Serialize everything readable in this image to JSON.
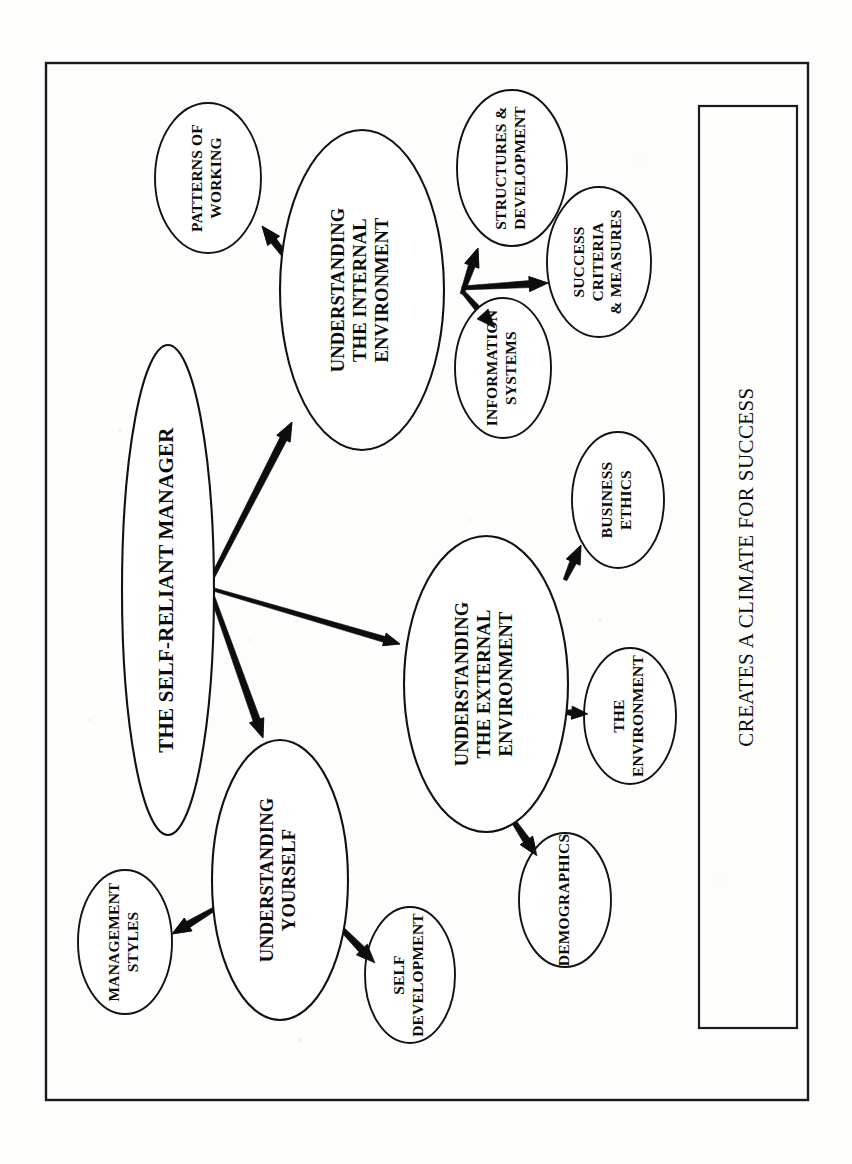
{
  "document": {
    "title": "The Self-Reliant Manager",
    "orientation": "rotated-90-ccw",
    "background_color": "#fdfdfc",
    "line_color": "#111111"
  },
  "frame": {
    "name": "outer-border"
  },
  "banner": {
    "name": "creates-a-climate-for-success-box",
    "text": "CREATES A CLIMATE FOR SUCCESS"
  },
  "nodes": {
    "root": {
      "id": "self-reliant-manager",
      "lines": [
        "THE SELF-RELIANT MANAGER"
      ],
      "cx": 168,
      "cy": 590,
      "rx": 46,
      "ry": 245,
      "font_size": 21
    },
    "branches": [
      {
        "id": "understanding-internal-environment",
        "lines": [
          "UNDERSTANDING",
          "THE INTERNAL",
          "ENVIRONMENT"
        ],
        "cx": 362,
        "cy": 290,
        "rx": 82,
        "ry": 160,
        "font_size": 18.5
      },
      {
        "id": "understanding-external-environment",
        "lines": [
          "UNDERSTANDING",
          "THE EXTERNAL",
          "ENVIRONMENT"
        ],
        "cx": 486,
        "cy": 684,
        "rx": 82,
        "ry": 148,
        "font_size": 18.5
      },
      {
        "id": "understanding-yourself",
        "lines": [
          "UNDERSTANDING",
          "YOURSELF"
        ],
        "cx": 280,
        "cy": 880,
        "rx": 68,
        "ry": 140,
        "font_size": 18.5
      }
    ],
    "leaves": [
      {
        "id": "patterns-of-working",
        "lines": [
          "PATTERNS OF",
          "WORKING"
        ],
        "cx": 208,
        "cy": 178,
        "rx": 53,
        "ry": 75,
        "font_size": 15.5
      },
      {
        "id": "structures-and-development",
        "lines": [
          "STRUCTURES &",
          "DEVELOPMENT"
        ],
        "cx": 512,
        "cy": 168,
        "rx": 55,
        "ry": 78,
        "font_size": 15.5
      },
      {
        "id": "success-criteria-and-measures",
        "lines": [
          "SUCCESS",
          "CRITERIA",
          "& MEASURES"
        ],
        "cx": 599,
        "cy": 262,
        "rx": 52,
        "ry": 75,
        "font_size": 15.5
      },
      {
        "id": "information-systems",
        "lines": [
          "INFORMATION",
          "SYSTEMS"
        ],
        "cx": 503,
        "cy": 368,
        "rx": 48,
        "ry": 70,
        "font_size": 15.5
      },
      {
        "id": "business-ethics",
        "lines": [
          "BUSINESS",
          "ETHICS"
        ],
        "cx": 618,
        "cy": 500,
        "rx": 46,
        "ry": 68,
        "font_size": 15.5
      },
      {
        "id": "the-environment",
        "lines": [
          "THE",
          "ENVIRONMENT"
        ],
        "cx": 630,
        "cy": 716,
        "rx": 46,
        "ry": 68,
        "font_size": 15.5
      },
      {
        "id": "demographics",
        "lines": [
          "DEMOGRAPHICS"
        ],
        "cx": 565,
        "cy": 900,
        "rx": 46,
        "ry": 67,
        "font_size": 15.5
      },
      {
        "id": "management-styles",
        "lines": [
          "MANAGEMENT",
          "STYLES"
        ],
        "cx": 125,
        "cy": 942,
        "rx": 47,
        "ry": 72,
        "font_size": 15.5
      },
      {
        "id": "self-development",
        "lines": [
          "SELF",
          "DEVELOPMENT"
        ],
        "cx": 410,
        "cy": 975,
        "rx": 45,
        "ry": 68,
        "font_size": 15.5
      }
    ]
  },
  "arrows": [
    {
      "id": "root-to-internal",
      "from": "self-reliant-manager",
      "to": "understanding-internal-environment",
      "x1": 210,
      "y1": 582,
      "x2": 292,
      "y2": 422,
      "width": 7.5,
      "head": 15
    },
    {
      "id": "root-to-external",
      "from": "self-reliant-manager",
      "to": "understanding-external-environment",
      "x1": 212,
      "y1": 589,
      "x2": 400,
      "y2": 644,
      "width": 6.0,
      "head": 13
    },
    {
      "id": "root-to-yourself",
      "from": "self-reliant-manager",
      "to": "understanding-yourself",
      "x1": 212,
      "y1": 595,
      "x2": 263,
      "y2": 738,
      "width": 7.5,
      "head": 15
    },
    {
      "id": "internal-to-patterns",
      "from": "understanding-internal-environment",
      "to": "patterns-of-working",
      "x1": 320,
      "y1": 300,
      "x2": 262,
      "y2": 226,
      "width": 7.0,
      "head": 15
    },
    {
      "id": "internal-to-structures",
      "from": "understanding-internal-environment",
      "to": "structures-and-development",
      "x1": 462,
      "y1": 294,
      "x2": 478,
      "y2": 248,
      "width": 7.0,
      "head": 15
    },
    {
      "id": "internal-to-success",
      "from": "understanding-internal-environment",
      "to": "success-criteria-and-measures",
      "x1": 462,
      "y1": 288,
      "x2": 548,
      "y2": 283,
      "width": 7.0,
      "head": 15
    },
    {
      "id": "internal-to-information",
      "from": "understanding-internal-environment",
      "to": "information-systems",
      "x1": 463,
      "y1": 292,
      "x2": 495,
      "y2": 328,
      "width": 7.0,
      "head": 15
    },
    {
      "id": "external-to-ethics",
      "from": "understanding-external-environment",
      "to": "business-ethics",
      "x1": 565,
      "y1": 580,
      "x2": 581,
      "y2": 545,
      "width": 7.0,
      "head": 15
    },
    {
      "id": "external-to-environment",
      "from": "understanding-external-environment",
      "to": "the-environment",
      "x1": 563,
      "y1": 712,
      "x2": 588,
      "y2": 714,
      "width": 6.0,
      "head": 13
    },
    {
      "id": "external-to-demographics",
      "from": "understanding-external-environment",
      "to": "demographics",
      "x1": 510,
      "y1": 816,
      "x2": 537,
      "y2": 856,
      "width": 7.5,
      "head": 15
    },
    {
      "id": "yourself-to-management",
      "from": "understanding-yourself",
      "to": "management-styles",
      "x1": 216,
      "y1": 908,
      "x2": 172,
      "y2": 934,
      "width": 7.0,
      "head": 15
    },
    {
      "id": "yourself-to-selfdev",
      "from": "understanding-yourself",
      "to": "self-development",
      "x1": 335,
      "y1": 922,
      "x2": 375,
      "y2": 963,
      "width": 7.5,
      "head": 15
    }
  ]
}
